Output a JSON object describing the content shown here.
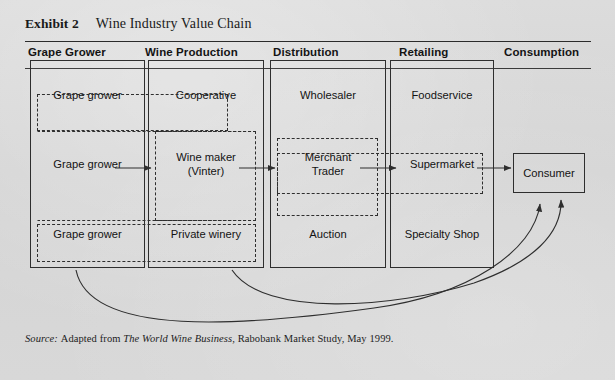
{
  "exhibit": {
    "label": "Exhibit 2",
    "title": "Wine Industry Value Chain"
  },
  "columns": [
    {
      "id": "grape-grower",
      "header": "Grape Grower"
    },
    {
      "id": "wine-production",
      "header": "Wine Production"
    },
    {
      "id": "distribution",
      "header": "Distribution"
    },
    {
      "id": "retailing",
      "header": "Retailing"
    },
    {
      "id": "consumption",
      "header": "Consumption"
    }
  ],
  "stages": {
    "grape_grower": {
      "cells": [
        "Grape grower",
        "Grape grower",
        "Grape grower"
      ]
    },
    "wine_production": {
      "cells": [
        "Cooperative",
        "Wine maker\n(Vinter)",
        "Private winery"
      ]
    },
    "distribution": {
      "cells": [
        "Wholesaler",
        "Merchant\nTrader",
        "Auction"
      ]
    },
    "retailing": {
      "cells": [
        "Foodservice",
        "Supermarket",
        "Specialty Shop"
      ]
    },
    "consumption": {
      "cells": [
        "Consumer"
      ]
    }
  },
  "groups": [
    {
      "id": "group-top",
      "note": "Grape grower to Cooperative"
    },
    {
      "id": "group-middle",
      "note": "Wine maker (Vinter) channel"
    },
    {
      "id": "group-trade",
      "note": "Merchant Trader to Supermarket"
    },
    {
      "id": "group-bottom",
      "note": "Grape grower to Private winery"
    }
  ],
  "flows": [
    {
      "id": "flow-grower-to-winemaker",
      "from": "Grape grower",
      "to": "Wine maker (Vinter)"
    },
    {
      "id": "flow-winemaker-to-merchant",
      "from": "Wine maker (Vinter)",
      "to": "Merchant Trader"
    },
    {
      "id": "flow-merchant-to-super",
      "from": "Merchant Trader",
      "to": "Supermarket"
    },
    {
      "id": "flow-super-to-consumer",
      "from": "Supermarket",
      "to": "Consumer"
    },
    {
      "id": "flow-winery-to-consumer",
      "from": "Wine Production",
      "to": "Consumer"
    },
    {
      "id": "flow-auction-to-consumer",
      "from": "Distribution",
      "to": "Consumer"
    }
  ],
  "source": {
    "prefix": "Source:",
    "text_before": "Adapted from ",
    "italic_title": "The World Wine Business",
    "text_after": ", Rabobank Market Study, May 1999."
  },
  "colors": {
    "background": "#d6d6d6",
    "line": "#2e2e2e",
    "text": "#131313"
  }
}
